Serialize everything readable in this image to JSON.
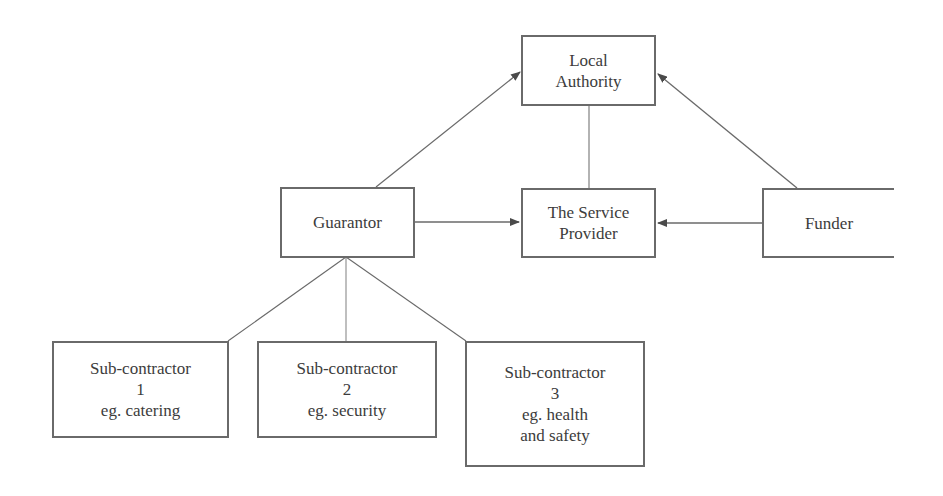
{
  "diagram": {
    "nodes": {
      "local_authority": {
        "lines": [
          "Local",
          "Authority"
        ]
      },
      "guarantor": {
        "lines": [
          "Guarantor"
        ]
      },
      "service_provider": {
        "lines": [
          "The Service",
          "Provider"
        ]
      },
      "funder": {
        "lines": [
          "Funder"
        ]
      },
      "sub1": {
        "lines": [
          "Sub-contractor",
          "1",
          "eg. catering"
        ]
      },
      "sub2": {
        "lines": [
          "Sub-contractor",
          "2",
          "eg. security"
        ]
      },
      "sub3": {
        "lines": [
          "Sub-contractor",
          "3",
          "eg. health",
          "and safety"
        ]
      }
    },
    "edges": [
      {
        "from": "guarantor",
        "to": "local_authority",
        "arrow": true
      },
      {
        "from": "funder",
        "to": "local_authority",
        "arrow": true
      },
      {
        "from": "local_authority",
        "to": "service_provider",
        "arrow": false
      },
      {
        "from": "guarantor",
        "to": "service_provider",
        "arrow": true
      },
      {
        "from": "funder",
        "to": "service_provider",
        "arrow": true
      },
      {
        "from": "guarantor",
        "to": "sub1",
        "arrow": false
      },
      {
        "from": "guarantor",
        "to": "sub2",
        "arrow": false
      },
      {
        "from": "guarantor",
        "to": "sub3",
        "arrow": false
      }
    ],
    "colors": {
      "line": "#6a6a6a",
      "text": "#3c3c3c"
    }
  }
}
